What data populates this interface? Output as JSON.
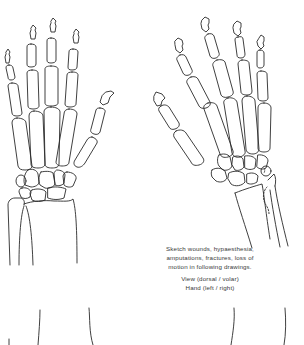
{
  "document": {
    "type": "hand skeleton assessment sheet",
    "figures": [
      {
        "name": "left-hand-skeleton",
        "view": "dorsal",
        "description": "Skeletal outline of hand and forearm, fingers pointing up, thumb on right"
      },
      {
        "name": "right-hand-skeleton",
        "view": "oblique",
        "description": "Skeletal outline of hand and forearm, fingers fanning up-right, thumb on left, ulna styloid dashed"
      }
    ],
    "instructions": {
      "lines": [
        "Sketch wounds, hypaesthesia,",
        "amputations, fractures, loss of",
        "motion in following drawings."
      ],
      "view_label": "View (dorsal / volar)",
      "hand_label": "Hand (left / right)"
    },
    "colors": {
      "line": "#2a2a2a",
      "text": "#3a3a3a",
      "background": "#ffffff"
    }
  }
}
